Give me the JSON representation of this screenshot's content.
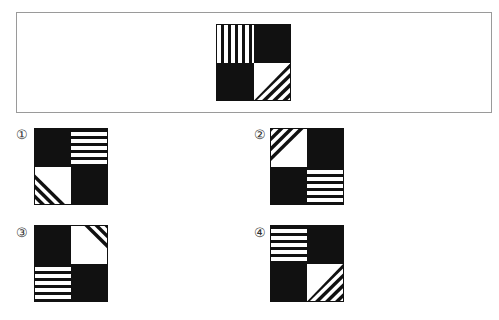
{
  "question": {
    "figure": {
      "tl": "vertical-stripes",
      "tr": "black",
      "bl": "black",
      "br": "diagonal-bottom-right"
    }
  },
  "options": [
    {
      "label": "①",
      "cells": {
        "tl": "black",
        "tr": "horizontal-stripes",
        "bl": "diagonal-bottom-left",
        "br": "black"
      }
    },
    {
      "label": "②",
      "cells": {
        "tl": "diagonal-top-left",
        "tr": "black",
        "bl": "black",
        "br": "horizontal-stripes"
      }
    },
    {
      "label": "③",
      "cells": {
        "tl": "black",
        "tr": "diagonal-top-right",
        "bl": "horizontal-stripes",
        "br": "black"
      }
    },
    {
      "label": "④",
      "cells": {
        "tl": "horizontal-stripes",
        "tr": "black",
        "bl": "black",
        "br": "diagonal-bottom-right"
      }
    }
  ],
  "colors": {
    "ink": "#111111",
    "paper": "#ffffff",
    "frame": "#9a9a9a"
  }
}
